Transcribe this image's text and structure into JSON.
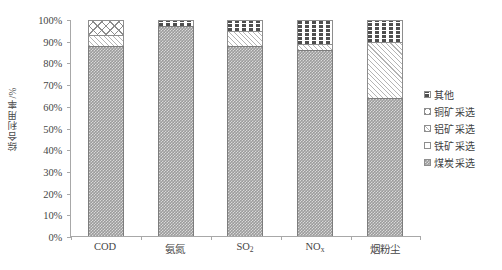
{
  "chart_data": {
    "type": "bar",
    "subtype": "stacked-100-percent",
    "title": "",
    "xlabel": "",
    "ylabel": "综合利用率/%",
    "ylim": [
      0,
      100
    ],
    "grid": false,
    "legend_position": "right",
    "categories": [
      "COD",
      "氨氮",
      "SO₂",
      "NOₓ",
      "烟粉尘"
    ],
    "category_labels_html": [
      "COD",
      "氨氮",
      "SO<sub>2</sub>",
      "NO<sub>x</sub>",
      "烟粉尘"
    ],
    "y_ticks": [
      "0%",
      "10%",
      "20%",
      "30%",
      "40%",
      "50%",
      "60%",
      "70%",
      "80%",
      "90%",
      "100%"
    ],
    "y_tick_values": [
      0,
      10,
      20,
      30,
      40,
      50,
      60,
      70,
      80,
      90,
      100
    ],
    "series": [
      {
        "name": "煤炭采选",
        "pattern": "pat-coal",
        "values": [
          88,
          97,
          88,
          86,
          64
        ]
      },
      {
        "name": "铁矿采选",
        "pattern": "pat-iron",
        "values": [
          0,
          0,
          0,
          0,
          0
        ]
      },
      {
        "name": "铝矿采选",
        "pattern": "pat-alum",
        "values": [
          5,
          0,
          7,
          3,
          26
        ]
      },
      {
        "name": "铜矿采选",
        "pattern": "pat-copper",
        "values": [
          7,
          0,
          0,
          0,
          0
        ]
      },
      {
        "name": "其他",
        "pattern": "pat-other",
        "values": [
          0,
          3,
          5,
          11,
          10
        ]
      }
    ],
    "legend_order_top_down": [
      "其他",
      "铜矿采选",
      "铝矿采选",
      "铁矿采选",
      "煤炭采选"
    ]
  },
  "axis": {
    "y_title": "综合利用率/%",
    "y_ticks": [
      "100%",
      "90%",
      "80%",
      "70%",
      "60%",
      "50%",
      "40%",
      "30%",
      "20%",
      "10%",
      "0%"
    ]
  },
  "x_axis": {
    "labels": [
      "COD",
      "氨氮",
      "SO",
      "NO",
      "烟粉尘"
    ],
    "sub_so2": "2",
    "sub_nox": "x"
  },
  "legend": {
    "items": [
      {
        "label": "其他"
      },
      {
        "label": "铜矿采选"
      },
      {
        "label": "铝矿采选"
      },
      {
        "label": "铁矿采选"
      },
      {
        "label": "煤炭采选"
      }
    ]
  },
  "colors": {
    "axis_line": "#a8a8a8",
    "text": "#464646",
    "coal_fill": "#9b9b9b",
    "hatch_line": "#b4b4b4",
    "crosshatch_line": "#8c8c8c",
    "dash_line": "#4e4e4e",
    "segment_border": "#8e8e8e",
    "background": "#ffffff"
  }
}
